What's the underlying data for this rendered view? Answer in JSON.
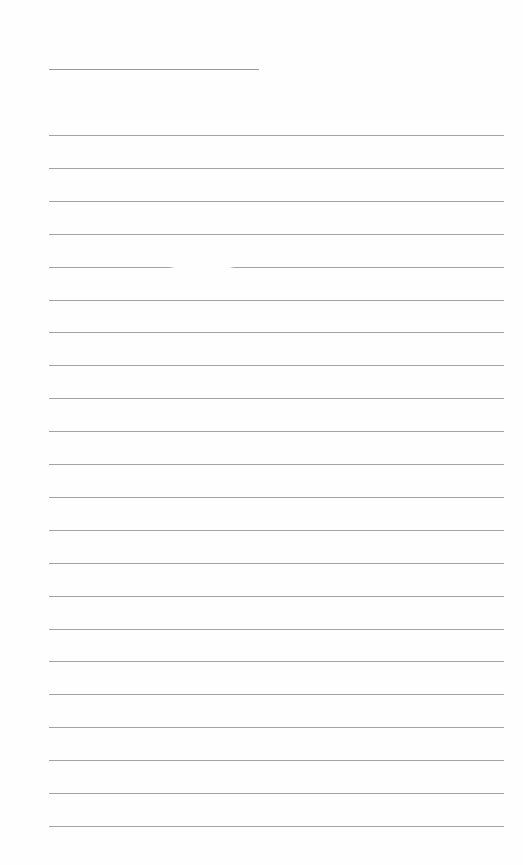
{
  "page": {
    "type": "blank lined sheet",
    "background_color": "#ffffff",
    "line_color": "#a3a3a3",
    "title_line": {
      "x": 49,
      "y": 69,
      "width": 210
    },
    "rules": {
      "count": 22,
      "x": 49,
      "width": 455,
      "first_y": 135,
      "spacing": 32.9,
      "gap_rule_index": 4
    }
  }
}
